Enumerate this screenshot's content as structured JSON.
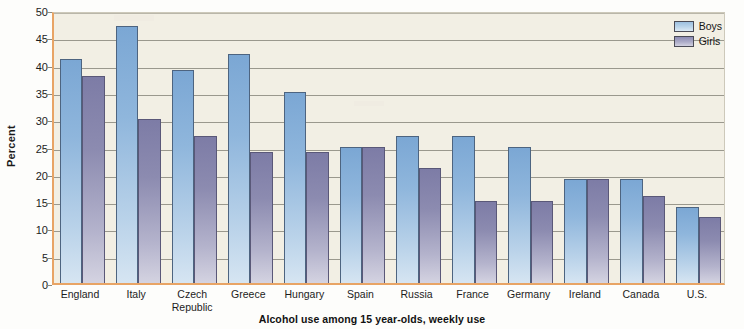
{
  "chart_data": {
    "type": "bar",
    "title": "",
    "caption": "Alcohol use among 15 year-olds, weekly use",
    "xlabel": "",
    "ylabel": "Percent",
    "ylim": [
      0,
      50
    ],
    "yticks": [
      0,
      5,
      10,
      15,
      20,
      25,
      30,
      35,
      40,
      45,
      50
    ],
    "ytick_labels": [
      "0",
      "5",
      "10",
      "15",
      "20",
      "25",
      "30",
      "35",
      "40",
      "45",
      "50"
    ],
    "grid": true,
    "legend_position": "top-right",
    "categories": [
      "England",
      "Italy",
      "Czech Republic",
      "Greece",
      "Hungary",
      "Spain",
      "Russia",
      "France",
      "Germany",
      "Ireland",
      "Canada",
      "U.S."
    ],
    "category_label_lines": [
      [
        "England"
      ],
      [
        "Italy"
      ],
      [
        "Czech",
        "Republic"
      ],
      [
        "Greece"
      ],
      [
        "Hungary"
      ],
      [
        "Spain"
      ],
      [
        "Russia"
      ],
      [
        "France"
      ],
      [
        "Germany"
      ],
      [
        "Ireland"
      ],
      [
        "Canada"
      ],
      [
        "U.S."
      ]
    ],
    "series": [
      {
        "name": "Boys",
        "color": "#8fb6dc",
        "values": [
          41,
          47,
          39,
          42,
          35,
          25,
          27,
          27,
          25,
          19,
          19,
          14
        ]
      },
      {
        "name": "Girls",
        "color": "#8c8bb0",
        "values": [
          38,
          30,
          27,
          24,
          24,
          25,
          21,
          15,
          15,
          19,
          16,
          12
        ]
      }
    ]
  },
  "legend": {
    "entries": [
      {
        "label": "Boys"
      },
      {
        "label": "Girls"
      }
    ]
  },
  "colors": {
    "plot_background": "#f2efe4",
    "axis": "#e8a465",
    "gridline": "#9a988d",
    "boys": "#8fb6dc",
    "girls": "#8c8bb0"
  }
}
